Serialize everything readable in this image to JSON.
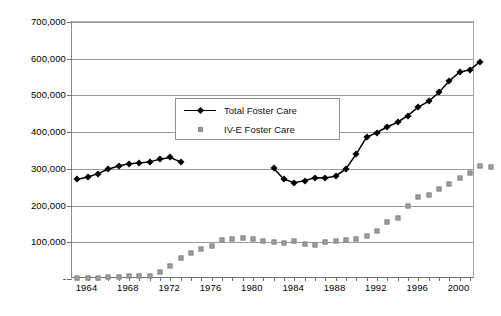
{
  "chart_data": {
    "type": "line",
    "title": "",
    "xlabel": "",
    "ylabel": "",
    "xlim": [
      1963,
      2001
    ],
    "ylim": [
      0,
      700000
    ],
    "grid": true,
    "legend_position": "upper-left-inside",
    "y_ticks": [
      0,
      100000,
      200000,
      300000,
      400000,
      500000,
      600000,
      700000
    ],
    "y_tick_labels": [
      "-",
      "100,000",
      "200,000",
      "300,000",
      "400,000",
      "500,000",
      "600,000",
      "700,000"
    ],
    "x_ticks": [
      1963,
      1964,
      1965,
      1966,
      1967,
      1968,
      1969,
      1970,
      1971,
      1972,
      1973,
      1974,
      1975,
      1976,
      1977,
      1978,
      1979,
      1980,
      1981,
      1982,
      1983,
      1984,
      1985,
      1986,
      1987,
      1988,
      1989,
      1990,
      1991,
      1992,
      1993,
      1994,
      1995,
      1996,
      1997,
      1998,
      1999,
      2000,
      2001
    ],
    "x_tick_labels": [
      "1964",
      "1968",
      "1972",
      "1976",
      "1980",
      "1984",
      "1988",
      "1992",
      "1996",
      "2000"
    ],
    "x_tick_label_values": [
      1964,
      1968,
      1972,
      1976,
      1980,
      1984,
      1988,
      1992,
      1996,
      2000
    ],
    "series": [
      {
        "name": "Total Foster Care",
        "marker": "diamond",
        "color": "#000000",
        "line": true,
        "points": [
          {
            "x": 1963,
            "y": 272000
          },
          {
            "x": 1964,
            "y": 277000
          },
          {
            "x": 1965,
            "y": 287000
          },
          {
            "x": 1966,
            "y": 299000
          },
          {
            "x": 1967,
            "y": 308000
          },
          {
            "x": 1968,
            "y": 314000
          },
          {
            "x": 1969,
            "y": 316000
          },
          {
            "x": 1970,
            "y": 319000
          },
          {
            "x": 1971,
            "y": 326000
          },
          {
            "x": 1972,
            "y": 331000
          },
          {
            "x": 1973,
            "y": 319000
          },
          {
            "x": 1982,
            "y": 302000
          },
          {
            "x": 1983,
            "y": 272000
          },
          {
            "x": 1984,
            "y": 262000
          },
          {
            "x": 1985,
            "y": 268000
          },
          {
            "x": 1986,
            "y": 276000
          },
          {
            "x": 1987,
            "y": 275000
          },
          {
            "x": 1988,
            "y": 280000
          },
          {
            "x": 1989,
            "y": 300000
          },
          {
            "x": 1990,
            "y": 340000
          },
          {
            "x": 1991,
            "y": 386000
          },
          {
            "x": 1992,
            "y": 399000
          },
          {
            "x": 1993,
            "y": 414000
          },
          {
            "x": 1994,
            "y": 427000
          },
          {
            "x": 1995,
            "y": 445000
          },
          {
            "x": 1996,
            "y": 468000
          },
          {
            "x": 1997,
            "y": 484000
          },
          {
            "x": 1998,
            "y": 508000
          },
          {
            "x": 1999,
            "y": 539000
          },
          {
            "x": 2000,
            "y": 563000
          },
          {
            "x": 2001,
            "y": 570000
          },
          {
            "x": 2002,
            "y": 592000
          }
        ]
      },
      {
        "name": "IV-E Foster Care",
        "marker": "square",
        "color": "#9d9d9d",
        "line": false,
        "points": [
          {
            "x": 1963,
            "y": 2000
          },
          {
            "x": 1964,
            "y": 3000
          },
          {
            "x": 1965,
            "y": 4000
          },
          {
            "x": 1966,
            "y": 5000
          },
          {
            "x": 1967,
            "y": 6000
          },
          {
            "x": 1968,
            "y": 7000
          },
          {
            "x": 1969,
            "y": 8000
          },
          {
            "x": 1970,
            "y": 9000
          },
          {
            "x": 1971,
            "y": 18000
          },
          {
            "x": 1972,
            "y": 36000
          },
          {
            "x": 1973,
            "y": 57000
          },
          {
            "x": 1974,
            "y": 71000
          },
          {
            "x": 1975,
            "y": 83000
          },
          {
            "x": 1976,
            "y": 91000
          },
          {
            "x": 1977,
            "y": 107000
          },
          {
            "x": 1978,
            "y": 110000
          },
          {
            "x": 1979,
            "y": 112000
          },
          {
            "x": 1980,
            "y": 108000
          },
          {
            "x": 1981,
            "y": 104000
          },
          {
            "x": 1982,
            "y": 102000
          },
          {
            "x": 1983,
            "y": 98000
          },
          {
            "x": 1984,
            "y": 104000
          },
          {
            "x": 1985,
            "y": 96000
          },
          {
            "x": 1986,
            "y": 93000
          },
          {
            "x": 1987,
            "y": 100000
          },
          {
            "x": 1988,
            "y": 104000
          },
          {
            "x": 1989,
            "y": 107000
          },
          {
            "x": 1990,
            "y": 109000
          },
          {
            "x": 1991,
            "y": 118000
          },
          {
            "x": 1992,
            "y": 131000
          },
          {
            "x": 1993,
            "y": 155000
          },
          {
            "x": 1994,
            "y": 167000
          },
          {
            "x": 1995,
            "y": 200000
          },
          {
            "x": 1996,
            "y": 222000
          },
          {
            "x": 1997,
            "y": 229000
          },
          {
            "x": 1998,
            "y": 244000
          },
          {
            "x": 1999,
            "y": 259000
          },
          {
            "x": 2000,
            "y": 274000
          },
          {
            "x": 2001,
            "y": 290000
          },
          {
            "x": 2002,
            "y": 307000
          },
          {
            "x": 2003,
            "y": 304000
          }
        ]
      }
    ]
  },
  "legend": {
    "items": [
      {
        "label": "Total Foster Care",
        "key": "line-diamond-marker"
      },
      {
        "label": "IV-E Foster Care",
        "key": "square-marker"
      }
    ]
  }
}
